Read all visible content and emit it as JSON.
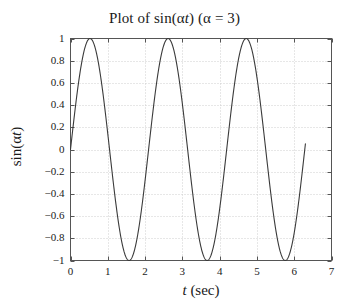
{
  "chart_data": {
    "type": "line",
    "title": "Plot of sin(αt)  (α = 3)",
    "title_parts": {
      "prefix": "Plot of sin(α",
      "var": "t",
      "middle": ")  (α = 3)"
    },
    "xlabel": "t (sec)",
    "xlabel_parts": {
      "var": "t",
      "rest": " (sec)"
    },
    "ylabel": "sin(αt)",
    "ylabel_parts": {
      "prefix": "sin(α",
      "var": "t",
      "suffix": ")"
    },
    "alpha": 3,
    "xlim": [
      0,
      7
    ],
    "ylim": [
      -1,
      1
    ],
    "xticks": [
      0,
      1,
      2,
      3,
      4,
      5,
      6,
      7
    ],
    "xtick_labels": [
      "0",
      "1",
      "2",
      "3",
      "4",
      "5",
      "6",
      "7"
    ],
    "yticks": [
      -1,
      -0.8,
      -0.6,
      -0.4,
      -0.2,
      0,
      0.2,
      0.4,
      0.6,
      0.8,
      1
    ],
    "ytick_labels": [
      "−1",
      "−0.8",
      "−0.6",
      "−0.4",
      "−0.2",
      "0",
      "0.2",
      "0.4",
      "0.6",
      "0.8",
      "1"
    ],
    "grid": true,
    "grid_style": "dotted",
    "legend": null,
    "series": [
      {
        "name": "sin(3t)",
        "color": "#3a3a3a",
        "x_start": 0,
        "x_end": 6.3,
        "formula": "sin(3*t)",
        "peaks": [
          {
            "t": 0.524,
            "y": 1
          },
          {
            "t": 2.618,
            "y": 1
          },
          {
            "t": 4.712,
            "y": 1
          }
        ],
        "troughs": [
          {
            "t": 1.571,
            "y": -1
          },
          {
            "t": 3.665,
            "y": -1
          },
          {
            "t": 5.76,
            "y": -1
          }
        ],
        "zero_crossings": [
          0,
          1.047,
          2.094,
          3.142,
          4.189,
          5.236,
          6.283
        ],
        "points": [
          {
            "t": 0.0,
            "y": 0.0
          },
          {
            "t": 0.1,
            "y": 0.2955
          },
          {
            "t": 0.2,
            "y": 0.5646
          },
          {
            "t": 0.3,
            "y": 0.7833
          },
          {
            "t": 0.4,
            "y": 0.932
          },
          {
            "t": 0.5,
            "y": 0.9975
          },
          {
            "t": 0.6,
            "y": 0.9738
          },
          {
            "t": 0.7,
            "y": 0.8632
          },
          {
            "t": 0.8,
            "y": 0.6755
          },
          {
            "t": 0.9,
            "y": 0.4274
          },
          {
            "t": 1.0,
            "y": 0.1411
          },
          {
            "t": 1.1,
            "y": -0.1577
          },
          {
            "t": 1.2,
            "y": -0.4425
          },
          {
            "t": 1.3,
            "y": -0.6878
          },
          {
            "t": 1.4,
            "y": -0.8716
          },
          {
            "t": 1.5,
            "y": -0.9775
          },
          {
            "t": 1.6,
            "y": -0.9962
          },
          {
            "t": 1.7,
            "y": -0.9258
          },
          {
            "t": 1.8,
            "y": -0.7728
          },
          {
            "t": 1.9,
            "y": -0.5507
          },
          {
            "t": 2.0,
            "y": -0.2794
          },
          {
            "t": 2.1,
            "y": 0.0168
          },
          {
            "t": 2.2,
            "y": 0.3115
          },
          {
            "t": 2.3,
            "y": 0.5784
          },
          {
            "t": 2.4,
            "y": 0.7937
          },
          {
            "t": 2.5,
            "y": 0.938
          },
          {
            "t": 2.6,
            "y": 0.9992
          },
          {
            "t": 2.7,
            "y": 0.9705
          },
          {
            "t": 2.8,
            "y": 0.8551
          },
          {
            "t": 2.9,
            "y": 0.6636
          },
          {
            "t": 3.0,
            "y": 0.4121
          },
          {
            "t": 3.1,
            "y": 0.1245
          },
          {
            "t": 3.2,
            "y": -0.1743
          },
          {
            "t": 3.3,
            "y": -0.4575
          },
          {
            "t": 3.4,
            "y": -0.6999
          },
          {
            "t": 3.5,
            "y": -0.8797
          },
          {
            "t": 3.6,
            "y": -0.981
          },
          {
            "t": 3.7,
            "y": -0.9946
          },
          {
            "t": 3.8,
            "y": -0.9193
          },
          {
            "t": 3.9,
            "y": -0.7618
          },
          {
            "t": 4.0,
            "y": -0.5366
          },
          {
            "t": 4.1,
            "y": -0.2634
          },
          {
            "t": 4.2,
            "y": 0.0332
          },
          {
            "t": 4.3,
            "y": 0.3273
          },
          {
            "t": 4.4,
            "y": 0.5921
          },
          {
            "t": 4.5,
            "y": 0.8038
          },
          {
            "t": 4.6,
            "y": 0.9437
          },
          {
            "t": 4.7,
            "y": 0.9999
          },
          {
            "t": 4.8,
            "y": 0.9661
          },
          {
            "t": 4.9,
            "y": 0.846
          },
          {
            "t": 5.0,
            "y": 0.6503
          },
          {
            "t": 5.1,
            "y": 0.3959
          },
          {
            "t": 5.2,
            "y": 0.1075
          },
          {
            "t": 5.3,
            "y": -0.1919
          },
          {
            "t": 5.4,
            "y": -0.4724
          },
          {
            "t": 5.5,
            "y": -0.7118
          },
          {
            "t": 5.6,
            "y": -0.8875
          },
          {
            "t": 5.7,
            "y": -0.9842
          },
          {
            "t": 5.8,
            "y": -0.9927
          },
          {
            "t": 5.9,
            "y": -0.9126
          },
          {
            "t": 6.0,
            "y": -0.751
          },
          {
            "t": 6.1,
            "y": -0.5218
          },
          {
            "t": 6.2,
            "y": -0.247
          },
          {
            "t": 6.283,
            "y": -0.0019
          },
          {
            "t": 6.3,
            "y": 0.0501
          }
        ]
      }
    ],
    "colors": {
      "curve": "#3a3a3a",
      "frame": "#555555",
      "grid": "#c9c9c9",
      "background": "#ffffff",
      "text": "#1a1a1a"
    }
  }
}
